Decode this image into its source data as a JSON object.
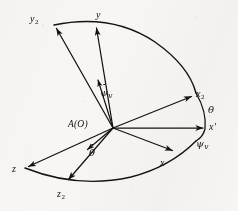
{
  "figure": {
    "name": "euler-angle-axes-diagram",
    "type": "vector-coordinate-diagram",
    "background_color": "#f7f6f4",
    "ink_color": "#15130f",
    "width": 238,
    "height": 211,
    "origin_label": "A(O)"
  },
  "labels": {
    "origin": "A(O)",
    "y2": "y",
    "y2_sub": "2",
    "y": "y",
    "x2": "x",
    "x2_sub": "2",
    "x_prime": "x",
    "x_prime_mark": "′",
    "x": "x",
    "z": "z",
    "z2": "z",
    "z2_sub": "2",
    "theta": "θ",
    "psi_v": "ψ",
    "psi_v_sub": "v",
    "psi_dot": "ψ",
    "psi_dot_sub": "v",
    "theta_dot": "θ"
  },
  "vectors": [
    {
      "name": "vector-y2",
      "label": "y₂",
      "from": [
        113,
        128
      ],
      "to": [
        55,
        26
      ],
      "arrowhead": true
    },
    {
      "name": "vector-y",
      "label": "y",
      "from": [
        113,
        128
      ],
      "to": [
        96,
        25
      ],
      "arrowhead": true
    },
    {
      "name": "vector-x2",
      "label": "x₂",
      "from": [
        113,
        128
      ],
      "to": [
        194,
        95
      ],
      "arrowhead": true
    },
    {
      "name": "vector-x-prime",
      "label": "x′",
      "from": [
        113,
        128
      ],
      "to": [
        207,
        128
      ],
      "arrowhead": true
    },
    {
      "name": "vector-x",
      "label": "x",
      "from": [
        113,
        128
      ],
      "to": [
        176,
        152
      ],
      "arrowhead": true
    },
    {
      "name": "vector-z",
      "label": "z",
      "from": [
        113,
        128
      ],
      "to": [
        25,
        167
      ],
      "arrowhead": true
    },
    {
      "name": "vector-z2",
      "label": "z₂",
      "from": [
        113,
        128
      ],
      "to": [
        67,
        182
      ],
      "arrowhead": true
    },
    {
      "name": "vector-psi-dot",
      "label": "ψ̇v",
      "from": [
        113,
        128
      ],
      "to": [
        97,
        77
      ],
      "arrowhead": true
    },
    {
      "name": "vector-theta-dot",
      "label": "θ̇",
      "from": [
        113,
        128
      ],
      "to": [
        85,
        152
      ],
      "arrowhead": true
    }
  ],
  "arcs": [
    {
      "name": "arc-upper",
      "description": "arc from y2 through y to x2",
      "endpoints": [
        "y₂",
        "x₂"
      ]
    },
    {
      "name": "arc-lower",
      "description": "arc from z through z2 to x",
      "endpoints": [
        "z",
        "x"
      ]
    },
    {
      "name": "arc-theta",
      "description": "arc segment between x2 and x-prime labelled theta",
      "angle_label": "θ"
    },
    {
      "name": "arc-psi",
      "description": "arc segment between x-prime and x labelled psi-v",
      "angle_label": "ψv"
    }
  ]
}
